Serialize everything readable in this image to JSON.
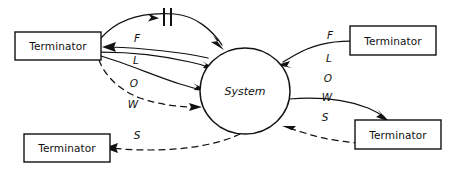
{
  "diagram": {
    "style": "hand-drawn",
    "background_color": "#ffffff",
    "ink_color": "#111111"
  },
  "process": {
    "label": "System",
    "shape": "circle"
  },
  "terminators": [
    {
      "id": "terminator-top-left",
      "label": "Terminator",
      "position": "top-left"
    },
    {
      "id": "terminator-bottom-left",
      "label": "Terminator",
      "position": "bottom-left"
    },
    {
      "id": "terminator-top-right",
      "label": "Terminator",
      "position": "top-right"
    },
    {
      "id": "terminator-bottom-right",
      "label": "Terminator",
      "position": "bottom-right"
    }
  ],
  "flow_labels": {
    "left_column": [
      "F",
      "L",
      "O",
      "W",
      "S"
    ],
    "right_column": [
      "F",
      "L",
      "O",
      "W",
      "S"
    ]
  },
  "left_flows": [
    {
      "id": "flow-left-1",
      "letter": "F",
      "line": "solid",
      "direction": "terminator-to-system",
      "marker": "double-bar"
    },
    {
      "id": "flow-left-2",
      "letter": "L",
      "line": "solid",
      "direction": "system-to-terminator",
      "marker": "none"
    },
    {
      "id": "flow-left-3",
      "letter": "O",
      "line": "solid",
      "direction": "terminator-to-system",
      "marker": "none"
    },
    {
      "id": "flow-left-4",
      "letter": "W",
      "line": "solid",
      "direction": "terminator-to-system",
      "marker": "none"
    },
    {
      "id": "flow-left-5",
      "letter": "S",
      "line": "dashed",
      "direction": "terminator-to-system",
      "marker": "none"
    }
  ],
  "right_flows": [
    {
      "id": "flow-right-1",
      "letter": "F",
      "line": "solid",
      "direction": "terminator-to-system"
    },
    {
      "id": "flow-right-2",
      "letter": "L",
      "line": "none",
      "direction": "none"
    },
    {
      "id": "flow-right-3",
      "letter": "O",
      "line": "none",
      "direction": "none"
    },
    {
      "id": "flow-right-4",
      "letter": "W",
      "line": "solid",
      "direction": "system-to-terminator"
    },
    {
      "id": "flow-right-5",
      "letter": "S",
      "line": "dashed",
      "direction": "terminator-to-system"
    }
  ],
  "bottom_flow": {
    "id": "flow-bottom-left",
    "line": "dashed",
    "direction": "system-to-terminator",
    "letter": "S"
  }
}
